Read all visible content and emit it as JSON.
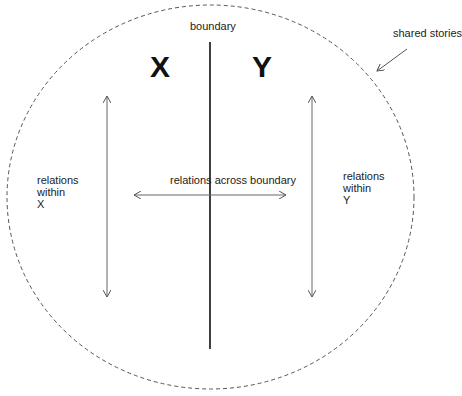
{
  "diagram": {
    "container": {
      "label": "shared stories",
      "style": "dashed ellipse"
    },
    "boundary": {
      "label": "boundary"
    },
    "sides": [
      {
        "name": "X",
        "relation_label_lines": [
          "relations",
          "within",
          "X"
        ]
      },
      {
        "name": "Y",
        "relation_label_lines": [
          "relations",
          "within",
          "Y"
        ]
      }
    ],
    "cross_relation": {
      "label": "relations across boundary"
    },
    "colors": {
      "line": "#222222",
      "arrow": "#555555",
      "dashed": "#555555",
      "text": "#222222"
    }
  }
}
